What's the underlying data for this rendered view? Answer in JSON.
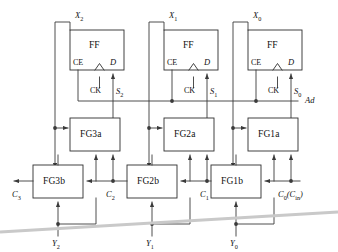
{
  "diagram": {
    "control_line_label": "Ad",
    "colors": {
      "line": "#3a3a3a",
      "box_stroke": "#2e2e2e",
      "text": "#111111",
      "fold_artifact": "#c9c9c9",
      "background": "#ffffff"
    }
  },
  "flipflops": [
    {
      "id": "ff2",
      "title": "FF",
      "ce": "CE",
      "ck": "CK",
      "d": "D",
      "data_in_label": "X",
      "data_in_sub": "2",
      "sum_label": "S",
      "sum_sub": "2"
    },
    {
      "id": "ff1",
      "title": "FF",
      "ce": "CE",
      "ck": "CK",
      "d": "D",
      "data_in_label": "X",
      "data_in_sub": "1",
      "sum_label": "S",
      "sum_sub": "1"
    },
    {
      "id": "ff0",
      "title": "FF",
      "ce": "CE",
      "ck": "CK",
      "d": "D",
      "data_in_label": "X",
      "data_in_sub": "0",
      "sum_label": "S",
      "sum_sub": "0"
    }
  ],
  "fg_row_a": [
    {
      "id": "fg3a",
      "label": "FG3a"
    },
    {
      "id": "fg2a",
      "label": "FG2a"
    },
    {
      "id": "fg1a",
      "label": "FG1a"
    }
  ],
  "fg_row_b": [
    {
      "id": "fg3b",
      "label": "FG3b"
    },
    {
      "id": "fg2b",
      "label": "FG2b"
    },
    {
      "id": "fg1b",
      "label": "FG1b"
    }
  ],
  "carries": [
    {
      "id": "c3",
      "label": "C",
      "sub": "3",
      "paren": ""
    },
    {
      "id": "c2",
      "label": "C",
      "sub": "2",
      "paren": ""
    },
    {
      "id": "c1",
      "label": "C",
      "sub": "1",
      "paren": ""
    },
    {
      "id": "c0",
      "label": "C",
      "sub": "0",
      "paren": "(C",
      "paren_sub": "in",
      "paren_end": ")"
    }
  ],
  "operands": [
    {
      "id": "y2",
      "label": "Y",
      "sub": "2"
    },
    {
      "id": "y1",
      "label": "Y",
      "sub": "1"
    },
    {
      "id": "y0",
      "label": "Y",
      "sub": "0"
    }
  ]
}
